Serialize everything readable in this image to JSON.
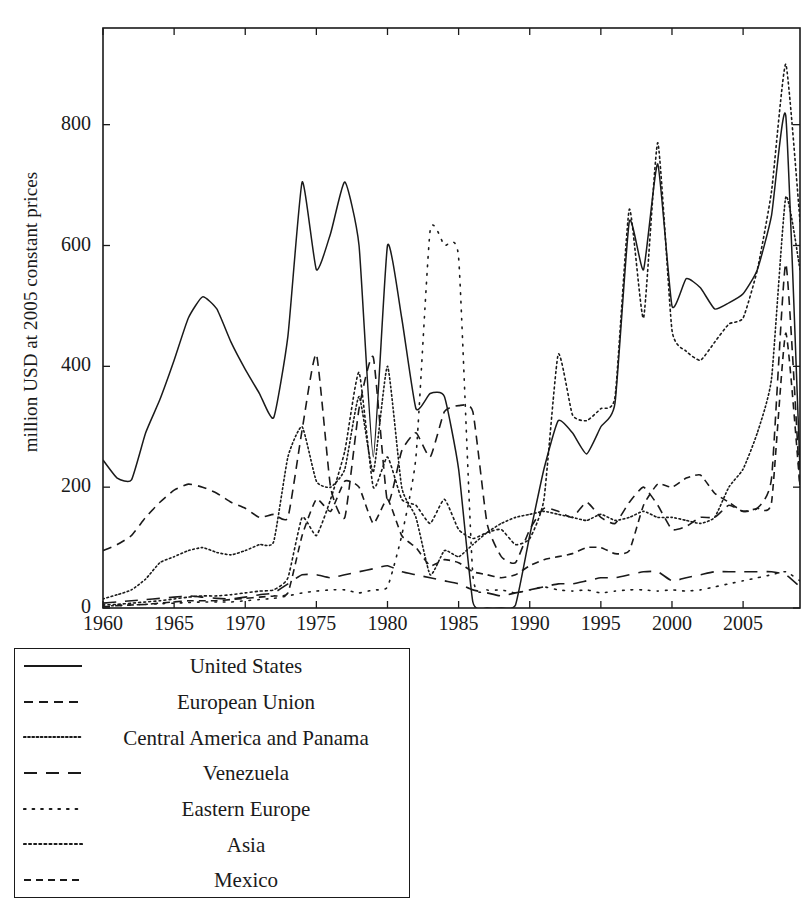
{
  "chart_data": {
    "type": "line",
    "title": "",
    "xlabel": "",
    "ylabel": "million USD at 2005 constant prices",
    "xlim": [
      1960,
      2009
    ],
    "ylim": [
      0,
      960
    ],
    "xticks": [
      1960,
      1965,
      1970,
      1975,
      1980,
      1985,
      1990,
      1995,
      2000,
      2005
    ],
    "yticks": [
      0,
      200,
      400,
      600,
      800
    ],
    "grid": false,
    "legend_position": "below-left",
    "x": [
      1960,
      1961,
      1962,
      1963,
      1964,
      1965,
      1966,
      1967,
      1968,
      1969,
      1970,
      1971,
      1972,
      1973,
      1974,
      1975,
      1976,
      1977,
      1978,
      1979,
      1980,
      1981,
      1982,
      1983,
      1984,
      1985,
      1986,
      1987,
      1988,
      1989,
      1990,
      1991,
      1992,
      1993,
      1994,
      1995,
      1996,
      1997,
      1998,
      1999,
      2000,
      2001,
      2002,
      2003,
      2004,
      2005,
      2006,
      2007,
      2008,
      2009
    ],
    "series": [
      {
        "name": "United States",
        "style": "solid",
        "values": [
          245,
          215,
          212,
          290,
          345,
          410,
          480,
          515,
          495,
          440,
          395,
          355,
          315,
          450,
          705,
          560,
          620,
          705,
          600,
          250,
          600,
          480,
          330,
          355,
          350,
          230,
          10,
          0,
          0,
          5,
          120,
          230,
          310,
          290,
          255,
          300,
          340,
          640,
          560,
          735,
          500,
          545,
          530,
          495,
          505,
          520,
          560,
          650,
          815,
          230
        ]
      },
      {
        "name": "European Union",
        "style": "dashed",
        "values": [
          95,
          105,
          120,
          150,
          175,
          195,
          205,
          200,
          190,
          175,
          165,
          150,
          155,
          150,
          295,
          420,
          200,
          150,
          330,
          415,
          175,
          260,
          290,
          250,
          325,
          335,
          325,
          140,
          85,
          75,
          130,
          165,
          160,
          150,
          175,
          150,
          140,
          175,
          200,
          170,
          130,
          135,
          150,
          150,
          170,
          160,
          165,
          215,
          570,
          200
        ]
      },
      {
        "name": "Central America and Panama",
        "style": "dotted-fine",
        "values": [
          15,
          22,
          30,
          48,
          75,
          85,
          95,
          100,
          92,
          88,
          95,
          105,
          110,
          250,
          300,
          210,
          200,
          230,
          350,
          225,
          400,
          200,
          150,
          55,
          95,
          85,
          105,
          125,
          140,
          150,
          155,
          160,
          155,
          150,
          145,
          155,
          145,
          150,
          160,
          150,
          150,
          145,
          140,
          150,
          200,
          230,
          290,
          380,
          680,
          560
        ]
      },
      {
        "name": "Venezuela",
        "style": "longdash",
        "values": [
          8,
          10,
          12,
          14,
          16,
          18,
          20,
          18,
          16,
          15,
          18,
          22,
          25,
          40,
          55,
          55,
          50,
          55,
          60,
          65,
          70,
          60,
          55,
          50,
          45,
          40,
          30,
          25,
          20,
          25,
          30,
          35,
          40,
          40,
          45,
          50,
          50,
          55,
          60,
          60,
          45,
          50,
          55,
          60,
          60,
          60,
          60,
          60,
          55,
          35
        ]
      },
      {
        "name": "Eastern Europe",
        "style": "dotted-sparse",
        "values": [
          3,
          4,
          5,
          6,
          7,
          8,
          9,
          10,
          10,
          10,
          12,
          14,
          16,
          20,
          25,
          28,
          30,
          30,
          25,
          30,
          35,
          120,
          250,
          625,
          600,
          580,
          55,
          30,
          30,
          25,
          30,
          35,
          30,
          28,
          30,
          25,
          28,
          30,
          30,
          28,
          30,
          28,
          30,
          35,
          40,
          45,
          50,
          55,
          60,
          45
        ]
      },
      {
        "name": "Asia",
        "style": "dotted-dense",
        "values": [
          5,
          6,
          8,
          10,
          12,
          15,
          18,
          20,
          20,
          22,
          25,
          28,
          30,
          50,
          150,
          120,
          180,
          260,
          390,
          200,
          250,
          180,
          170,
          140,
          180,
          130,
          115,
          125,
          130,
          105,
          115,
          180,
          420,
          320,
          310,
          330,
          350,
          660,
          480,
          770,
          460,
          425,
          410,
          440,
          470,
          480,
          560,
          690,
          900,
          640
        ]
      },
      {
        "name": "Mexico",
        "style": "dashed-medium",
        "values": [
          2,
          4,
          5,
          6,
          8,
          10,
          12,
          12,
          12,
          14,
          16,
          18,
          20,
          25,
          120,
          180,
          160,
          210,
          200,
          140,
          180,
          120,
          100,
          70,
          80,
          75,
          60,
          55,
          50,
          55,
          70,
          80,
          85,
          90,
          100,
          100,
          90,
          95,
          170,
          205,
          200,
          215,
          220,
          190,
          175,
          160,
          165,
          175,
          455,
          200
        ]
      }
    ]
  },
  "axis": {
    "ylabel": "million USD at 2005 constant prices",
    "ytick_labels": [
      "0",
      "200",
      "400",
      "600",
      "800"
    ],
    "xtick_labels": [
      "1960",
      "1965",
      "1970",
      "1975",
      "1980",
      "1985",
      "1990",
      "1995",
      "2000",
      "2005"
    ]
  },
  "legend": {
    "items": [
      {
        "label": "United States",
        "key": "solid-line-key"
      },
      {
        "label": "European Union",
        "key": "dashed-line-key"
      },
      {
        "label": "Central America and Panama",
        "key": "fine-dotted-line-key"
      },
      {
        "label": "Venezuela",
        "key": "long-dashed-line-key"
      },
      {
        "label": "Eastern Europe",
        "key": "sparse-dotted-line-key"
      },
      {
        "label": "Asia",
        "key": "dense-dotted-line-key"
      },
      {
        "label": "Mexico",
        "key": "medium-dashed-line-key"
      }
    ]
  },
  "colors": {
    "line": "#1a1a1a",
    "axis": "#1a1a1a",
    "background": "#ffffff"
  }
}
